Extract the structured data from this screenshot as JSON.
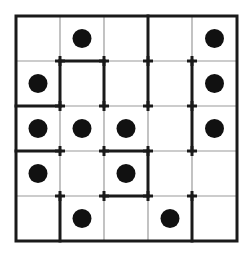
{
  "puzzle": {
    "rows": 5,
    "cols": 5,
    "colors": {
      "background": "#ffffff",
      "thin_line": "#9a9a9a",
      "thick_line": "#1a1a1a",
      "dot": "#111111"
    },
    "grid": {
      "x": [
        16,
        60,
        104,
        148,
        192,
        237
      ],
      "y": [
        16,
        61,
        106,
        151,
        196,
        241
      ]
    },
    "dots": [
      {
        "row": 0,
        "col": 1
      },
      {
        "row": 0,
        "col": 4
      },
      {
        "row": 1,
        "col": 0
      },
      {
        "row": 1,
        "col": 4
      },
      {
        "row": 2,
        "col": 0
      },
      {
        "row": 2,
        "col": 1
      },
      {
        "row": 2,
        "col": 2
      },
      {
        "row": 2,
        "col": 4
      },
      {
        "row": 3,
        "col": 0
      },
      {
        "row": 3,
        "col": 2
      },
      {
        "row": 4,
        "col": 1
      },
      {
        "row": 4,
        "col": 3
      }
    ],
    "thick_segments": [
      {
        "x1": 1,
        "y1": 1,
        "x2": 2,
        "y2": 1
      },
      {
        "x1": 1,
        "y1": 1,
        "x2": 1,
        "y2": 2
      },
      {
        "x1": 2,
        "y1": 1,
        "x2": 2,
        "y2": 2
      },
      {
        "x1": 0,
        "y1": 2,
        "x2": 1,
        "y2": 2
      },
      {
        "x1": 3,
        "y1": 0,
        "x2": 3,
        "y2": 2
      },
      {
        "x1": 4,
        "y1": 1,
        "x2": 4,
        "y2": 3
      },
      {
        "x1": 0,
        "y1": 3,
        "x2": 1,
        "y2": 3
      },
      {
        "x1": 2,
        "y1": 3,
        "x2": 3,
        "y2": 3
      },
      {
        "x1": 3,
        "y1": 3,
        "x2": 3,
        "y2": 4
      },
      {
        "x1": 2,
        "y1": 4,
        "x2": 3,
        "y2": 4
      },
      {
        "x1": 1,
        "y1": 4,
        "x2": 1,
        "y2": 5
      },
      {
        "x1": 4,
        "y1": 4,
        "x2": 4,
        "y2": 5
      }
    ],
    "markers": [
      {
        "x": 1,
        "y": 1
      },
      {
        "x": 2,
        "y": 1
      },
      {
        "x": 3,
        "y": 1
      },
      {
        "x": 4,
        "y": 1
      },
      {
        "x": 1,
        "y": 2
      },
      {
        "x": 2,
        "y": 2
      },
      {
        "x": 3,
        "y": 2
      },
      {
        "x": 4,
        "y": 2
      },
      {
        "x": 1,
        "y": 3
      },
      {
        "x": 2,
        "y": 3
      },
      {
        "x": 3,
        "y": 3
      },
      {
        "x": 4,
        "y": 3
      },
      {
        "x": 1,
        "y": 4
      },
      {
        "x": 2,
        "y": 4
      },
      {
        "x": 3,
        "y": 4
      },
      {
        "x": 4,
        "y": 4
      }
    ]
  }
}
